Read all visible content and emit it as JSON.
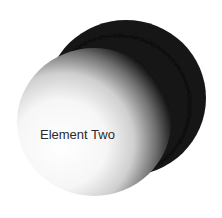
{
  "diagram": {
    "elements": [
      {
        "id": "element-one",
        "label": "",
        "shading": "dark"
      },
      {
        "id": "element-two",
        "label": "Element Two",
        "shading": "light-to-dark"
      }
    ]
  },
  "colors": {
    "back_light": "#4a4a4a",
    "back_dark": "#0c0c0c",
    "front_highlight": "#ffffff",
    "front_mid": "#bdbdbd",
    "front_shadow": "#050505",
    "label": "#2a2a2a",
    "background": "#ffffff"
  }
}
